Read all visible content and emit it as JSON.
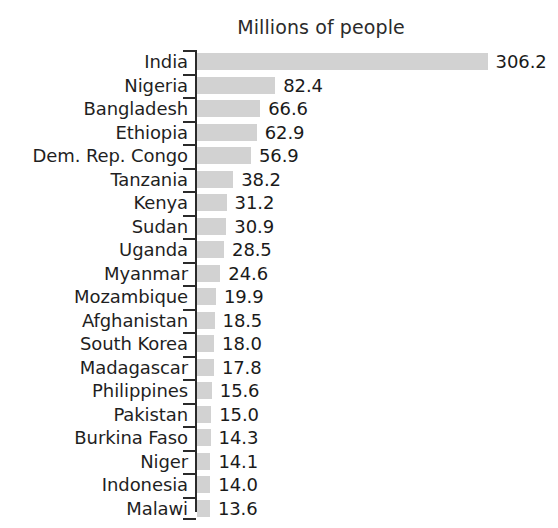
{
  "chart_data": {
    "type": "bar",
    "orientation": "horizontal",
    "title": "Millions of people",
    "xlabel": "",
    "ylabel": "",
    "grid": false,
    "legend": null,
    "axis_ticks_visible": true,
    "xlim": [
      0,
      306.2
    ],
    "categories": [
      "India",
      "Nigeria",
      "Bangladesh",
      "Ethiopia",
      "Dem. Rep. Congo",
      "Tanzania",
      "Kenya",
      "Sudan",
      "Uganda",
      "Myanmar",
      "Mozambique",
      "Afghanistan",
      "South Korea",
      "Madagascar",
      "Philippines",
      "Pakistan",
      "Burkina Faso",
      "Niger",
      "Indonesia",
      "Malawi"
    ],
    "values": [
      306.2,
      82.4,
      66.6,
      62.9,
      56.9,
      38.2,
      31.2,
      30.9,
      28.5,
      24.6,
      19.9,
      18.5,
      18.0,
      17.8,
      15.6,
      15.0,
      14.3,
      14.1,
      14.0,
      13.6
    ],
    "value_labels": [
      "306.2",
      "82.4",
      "66.6",
      "62.9",
      "56.9",
      "38.2",
      "31.2",
      "30.9",
      "28.5",
      "24.6",
      "19.9",
      "18.5",
      "18.0",
      "17.8",
      "15.6",
      "15.0",
      "14.3",
      "14.1",
      "14.0",
      "13.6"
    ],
    "bar_color": "#d2d2d2",
    "axis_color": "#2a2a2a",
    "text_color": "#1a1a1a"
  }
}
